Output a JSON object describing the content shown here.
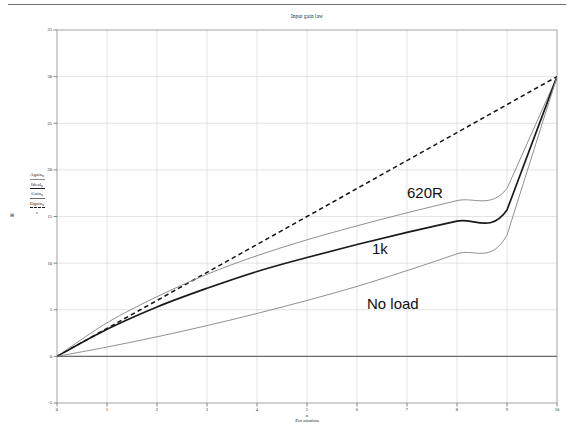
{
  "chart_data": {
    "type": "line",
    "title": "Input gain law",
    "xlabel": "Pot rotation",
    "xlabel_var": "n",
    "ylabel": "",
    "xlim": [
      0,
      10
    ],
    "ylim": [
      -5,
      35
    ],
    "xticks": [
      "0",
      "1",
      "2",
      "3",
      "4",
      "5",
      "6",
      "7",
      "8",
      "9",
      "10"
    ],
    "yticks": [
      "35",
      "30",
      "25",
      "20",
      "15",
      "10",
      "5",
      "0",
      "-5"
    ],
    "grid": true,
    "legend_position": "y-axis-stack",
    "x": [
      0,
      1,
      2,
      3,
      4,
      5,
      6,
      7,
      8,
      9,
      10
    ],
    "series": [
      {
        "name": "Ideal",
        "style": "dashed",
        "color": "#141414",
        "values": [
          0,
          3,
          6,
          9,
          12,
          15,
          18,
          21,
          24,
          27,
          30
        ]
      },
      {
        "name": "620R",
        "style": "solid",
        "color": "#8a8a8a",
        "values": [
          0,
          3.6,
          6.4,
          8.8,
          10.8,
          12.5,
          14.0,
          15.4,
          16.7,
          18.0,
          30
        ]
      },
      {
        "name": "1k",
        "style": "solid-bold",
        "color": "#1a1a1a",
        "values": [
          0,
          2.9,
          5.3,
          7.3,
          9.1,
          10.6,
          12.0,
          13.3,
          14.5,
          15.7,
          30
        ]
      },
      {
        "name": "No load",
        "style": "solid",
        "color": "#8a8a8a",
        "values": [
          0,
          1.0,
          2.1,
          3.3,
          4.6,
          6.0,
          7.5,
          9.2,
          11.0,
          13.0,
          30
        ]
      }
    ],
    "annotations": [
      {
        "text": "620R",
        "x": 7.0,
        "y": 17.5
      },
      {
        "text": "1k",
        "x": 6.3,
        "y": 11.5
      },
      {
        "text": "No load",
        "x": 6.2,
        "y": 5.6
      }
    ]
  },
  "ylegend": {
    "items": [
      {
        "var": "Again",
        "sub": "n",
        "style": "solid-gray"
      },
      {
        "var": "Ideal",
        "sub": "n",
        "style": "solid-dark"
      },
      {
        "var": "Gain",
        "sub": "n",
        "style": "solid-mid"
      },
      {
        "var": "Dgain",
        "sub": "n",
        "style": "dashed"
      }
    ],
    "tail": "ε",
    "bullet": "⊞"
  }
}
